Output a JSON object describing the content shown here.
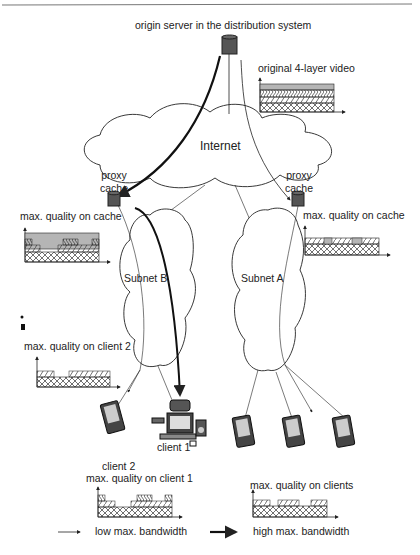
{
  "figure": {
    "top_rule": true,
    "labels": {
      "origin_server": "origin server in the distribution system",
      "original_video": "original 4-layer video",
      "internet": "Internet",
      "proxy_cache_left": "proxy\ncache",
      "proxy_cache_right": "proxy\ncache",
      "proxy_left_l1": "proxy",
      "proxy_left_l2": "cache",
      "proxy_right_l1": "proxy",
      "proxy_right_l2": "cache",
      "max_quality_cache_left": "max. quality on cache",
      "max_quality_cache_right": "max. quality on cache",
      "subnet_b": "Subnet B",
      "subnet_a": "Subnet A",
      "max_quality_client2": "max. quality on client 2",
      "client1": "client 1",
      "client2": "client 2",
      "max_quality_client1": "max. quality on client 1",
      "max_quality_clients": "max. quality on clients"
    },
    "legend": [
      {
        "label": "low max. bandwidth",
        "line": "thin-arrow"
      },
      {
        "label": "high max. bandwidth",
        "line": "thick-arrow"
      }
    ],
    "layer_patterns": [
      "cross-hatch (base layer)",
      "diagonal hatch (layer 2)",
      "chevron hatch (layer 3)",
      "solid gray (layer 4)"
    ],
    "colors": {
      "line": "#222222",
      "layer4_gray": "#b5b5b5",
      "server_fill": "#555555"
    }
  }
}
